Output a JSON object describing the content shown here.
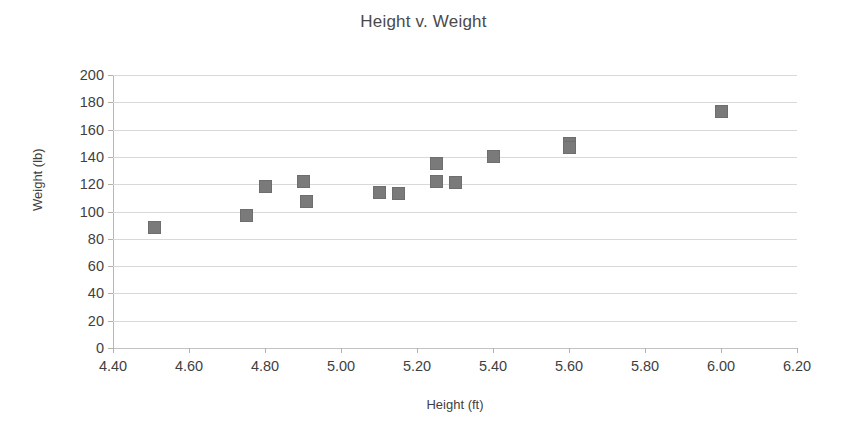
{
  "chart_data": {
    "type": "scatter",
    "title": "Height v. Weight",
    "xlabel": "Height (ft)",
    "ylabel": "Weight (lb)",
    "xlim": [
      4.4,
      6.2
    ],
    "ylim": [
      0,
      200
    ],
    "xticks": [
      "4.40",
      "4.60",
      "4.80",
      "5.00",
      "5.20",
      "5.40",
      "5.60",
      "5.80",
      "6.00",
      "6.20"
    ],
    "xtick_values": [
      4.4,
      4.6,
      4.8,
      5.0,
      5.2,
      5.4,
      5.6,
      5.8,
      6.0,
      6.2
    ],
    "yticks": [
      "200",
      "180",
      "160",
      "140",
      "120",
      "100",
      "80",
      "60",
      "40",
      "20",
      "0"
    ],
    "ytick_values": [
      200,
      180,
      160,
      140,
      120,
      100,
      80,
      60,
      40,
      20,
      0
    ],
    "grid": "horizontal",
    "legend": "none",
    "marker_color": "#7a7a7a",
    "marker_shape": "square",
    "points": [
      {
        "x": 4.51,
        "y": 88
      },
      {
        "x": 4.75,
        "y": 97
      },
      {
        "x": 4.8,
        "y": 118
      },
      {
        "x": 4.9,
        "y": 122
      },
      {
        "x": 4.91,
        "y": 107
      },
      {
        "x": 5.1,
        "y": 114
      },
      {
        "x": 5.15,
        "y": 113
      },
      {
        "x": 5.25,
        "y": 135
      },
      {
        "x": 5.25,
        "y": 122
      },
      {
        "x": 5.3,
        "y": 121
      },
      {
        "x": 5.4,
        "y": 140
      },
      {
        "x": 5.6,
        "y": 150
      },
      {
        "x": 5.6,
        "y": 147
      },
      {
        "x": 6.0,
        "y": 173
      }
    ]
  }
}
